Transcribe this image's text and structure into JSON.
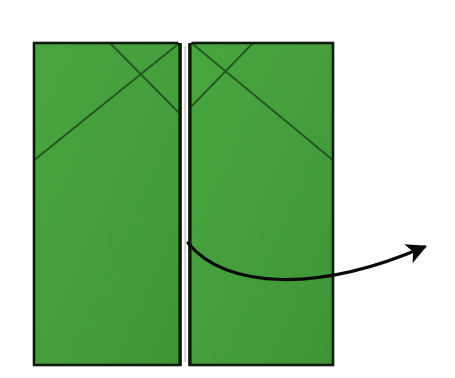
{
  "figure": {
    "title": "Origami fold step diagram",
    "description": "Two green paper panels side by side with crease lines and a curved action arrow pointing outward to the upper right",
    "canvas": {
      "width": 455,
      "height": 378,
      "background": "#ffffff"
    }
  },
  "colors": {
    "paper_fill": "#45a03c",
    "paper_fill_shade": "#3f9836",
    "paper_outline": "#0d1a0b",
    "crease_line": "#24561f",
    "arrow": "#0a0a0a",
    "gap": "#ffffff",
    "background": "#ffffff"
  },
  "panels": [
    {
      "id": "left-panel",
      "label": "Left flap",
      "x": 34,
      "y": 43,
      "width": 146,
      "height": 322,
      "creases": [
        {
          "name": "x-crease-left-down",
          "x1": 110,
          "y1": 43,
          "x2": 181,
          "y2": 114
        },
        {
          "name": "x-crease-right-down",
          "x1": 181,
          "y1": 43,
          "x2": 34,
          "y2": 160
        },
        {
          "name": "valley-diagonal",
          "x1": 181,
          "y1": 110,
          "x2": 34,
          "y2": 160
        }
      ]
    },
    {
      "id": "right-panel",
      "label": "Right flap",
      "x": 190,
      "y": 43,
      "width": 143,
      "height": 322,
      "creases": [
        {
          "name": "x-crease-left-down",
          "x1": 192,
          "y1": 43,
          "x2": 272,
          "y2": 43
        },
        {
          "name": "x-crease-right-down",
          "x1": 255,
          "y1": 43,
          "x2": 190,
          "y2": 110
        },
        {
          "name": "valley-diagonal",
          "x1": 192,
          "y1": 46,
          "x2": 333,
          "y2": 160
        }
      ]
    }
  ],
  "center_divide": {
    "name": "center-seam",
    "x": 180,
    "width": 10,
    "top": 43,
    "bottom": 365,
    "notch_top": 40,
    "notch_height": 5
  },
  "arrow": {
    "name": "fold-direction-arrow",
    "meaning": "Fold / swing this flap outward to the right",
    "start": {
      "x": 188,
      "y": 243
    },
    "control_1": {
      "x": 226,
      "y": 290
    },
    "control_2": {
      "x": 320,
      "y": 292
    },
    "end": {
      "x": 424,
      "y": 247
    },
    "head": {
      "x": 432,
      "y": 239,
      "angle_deg": -40,
      "size": 19
    },
    "stroke_width": 3.2
  },
  "labels": {
    "figure_caption": "",
    "step_number": ""
  }
}
